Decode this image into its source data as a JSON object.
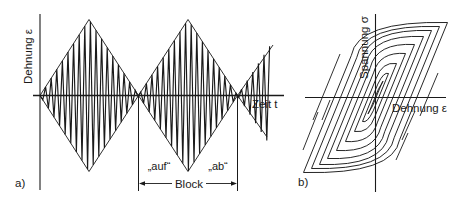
{
  "panel_a": {
    "label": "a)",
    "y_axis_label": "Dehnung ε",
    "x_axis_label": "Zeit t",
    "block_label": "Block",
    "ascending_label": "„auf“",
    "descending_label": "„ab“",
    "description": "Strain–time history: block loading with amplitude rising and falling linearly (triangular envelopes), filled with high-frequency oscillation"
  },
  "panel_b": {
    "label": "b)",
    "y_axis_label": "Spannung σ",
    "x_axis_label": "Dehnung ε",
    "description": "Stress–strain response: nested cyclic hysteresis loops"
  },
  "colors": {
    "ink": "#1a1a1a",
    "background": "#ffffff"
  }
}
